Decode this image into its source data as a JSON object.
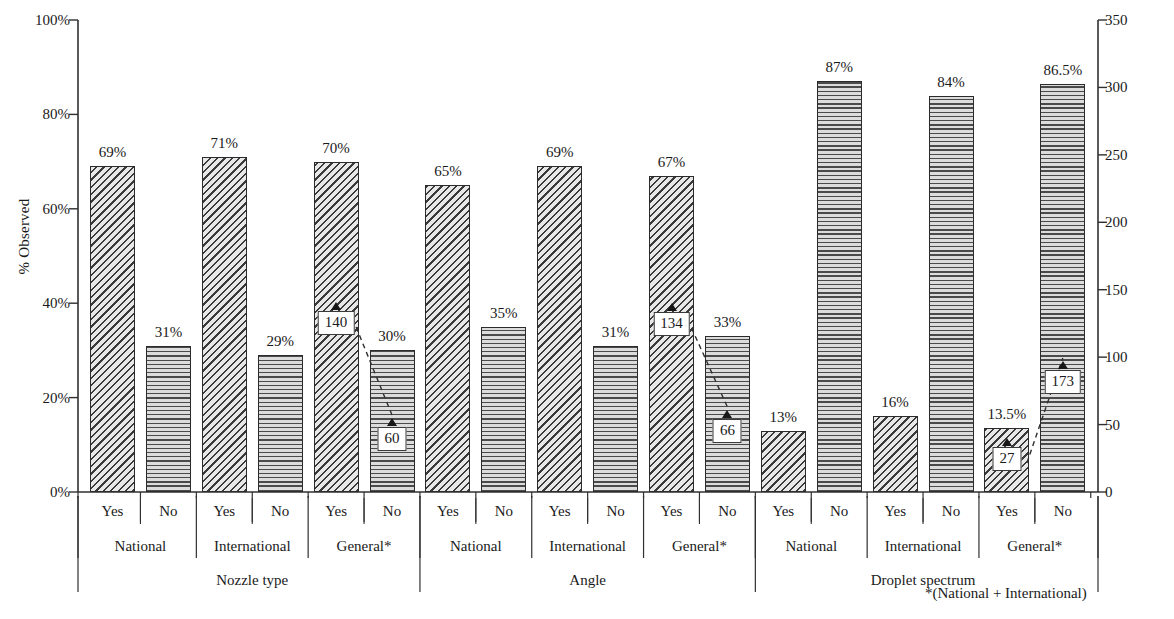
{
  "chart_data": {
    "type": "bar",
    "title": "",
    "ylabel": "% Observed",
    "ylabel_secondary": "Number of observations",
    "xlabel": "",
    "ylim": [
      0,
      100
    ],
    "ylim_secondary": [
      0,
      350
    ],
    "ytick_labels": [
      "0%",
      "20%",
      "40%",
      "60%",
      "80%",
      "100%"
    ],
    "ytick_values": [
      0,
      20,
      40,
      60,
      80,
      100
    ],
    "ytick_labels_secondary": [
      "0",
      "50",
      "100",
      "150",
      "200",
      "250",
      "300",
      "350"
    ],
    "ytick_values_secondary": [
      0,
      50,
      100,
      150,
      200,
      250,
      300,
      350
    ],
    "grid": false,
    "legend": "none",
    "footnote": "*(National + International)",
    "sections": [
      "Nozzle type",
      "Angle",
      "Droplet spectrum"
    ],
    "groups": [
      "National",
      "International",
      "General*"
    ],
    "categories": [
      "Yes",
      "No"
    ],
    "bars": [
      {
        "section": "Nozzle type",
        "group": "National",
        "category": "Yes",
        "value": 69,
        "label": "69%"
      },
      {
        "section": "Nozzle type",
        "group": "National",
        "category": "No",
        "value": 31,
        "label": "31%"
      },
      {
        "section": "Nozzle type",
        "group": "International",
        "category": "Yes",
        "value": 71,
        "label": "71%"
      },
      {
        "section": "Nozzle type",
        "group": "International",
        "category": "No",
        "value": 29,
        "label": "29%"
      },
      {
        "section": "Nozzle type",
        "group": "General*",
        "category": "Yes",
        "value": 70,
        "label": "70%",
        "callout": "140"
      },
      {
        "section": "Nozzle type",
        "group": "General*",
        "category": "No",
        "value": 30,
        "label": "30%",
        "callout": "60"
      },
      {
        "section": "Angle",
        "group": "National",
        "category": "Yes",
        "value": 65,
        "label": "65%"
      },
      {
        "section": "Angle",
        "group": "National",
        "category": "No",
        "value": 35,
        "label": "35%"
      },
      {
        "section": "Angle",
        "group": "International",
        "category": "Yes",
        "value": 69,
        "label": "69%"
      },
      {
        "section": "Angle",
        "group": "International",
        "category": "No",
        "value": 31,
        "label": "31%"
      },
      {
        "section": "Angle",
        "group": "General*",
        "category": "Yes",
        "value": 67,
        "label": "67%",
        "callout": "134"
      },
      {
        "section": "Angle",
        "group": "General*",
        "category": "No",
        "value": 33,
        "label": "33%",
        "callout": "66"
      },
      {
        "section": "Droplet spectrum",
        "group": "National",
        "category": "Yes",
        "value": 13,
        "label": "13%"
      },
      {
        "section": "Droplet spectrum",
        "group": "National",
        "category": "No",
        "value": 87,
        "label": "87%"
      },
      {
        "section": "Droplet spectrum",
        "group": "International",
        "category": "Yes",
        "value": 16,
        "label": "16%"
      },
      {
        "section": "Droplet spectrum",
        "group": "International",
        "category": "No",
        "value": 84,
        "label": "84%"
      },
      {
        "section": "Droplet spectrum",
        "group": "General*",
        "category": "Yes",
        "value": 13.5,
        "label": "13.5%",
        "callout": "27"
      },
      {
        "section": "Droplet spectrum",
        "group": "General*",
        "category": "No",
        "value": 86.5,
        "label": "86.5%",
        "callout": "173"
      }
    ]
  }
}
